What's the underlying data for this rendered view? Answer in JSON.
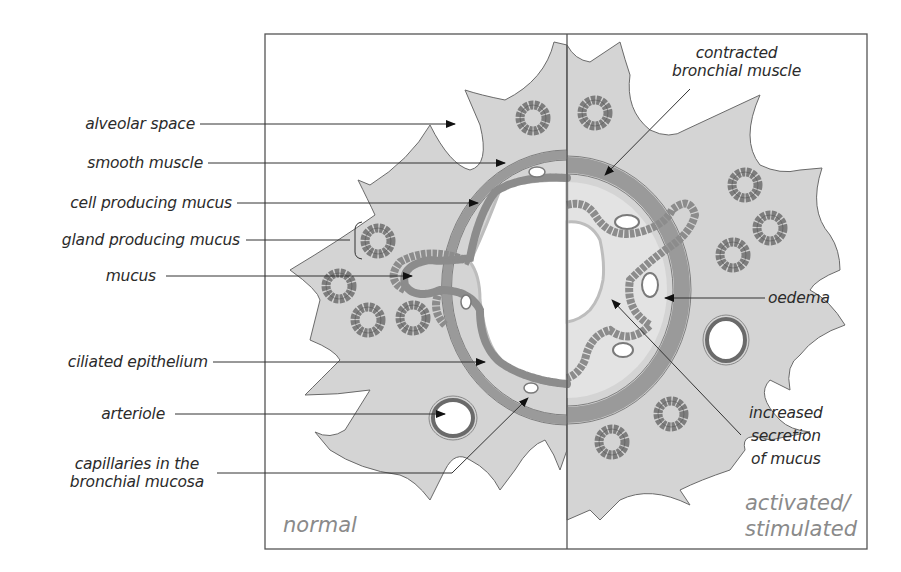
{
  "diagram": {
    "panels": {
      "left": "normal",
      "right_line1": "activated/",
      "right_line2": "stimulated"
    },
    "labels_left": [
      {
        "text": "alveolar space"
      },
      {
        "text": "smooth muscle"
      },
      {
        "text": "cell producing mucus"
      },
      {
        "text": "gland producing mucus"
      },
      {
        "text": "mucus"
      },
      {
        "text": "ciliated epithelium"
      },
      {
        "text": "arteriole"
      },
      {
        "text": "capillaries in the",
        "text2": "bronchial mucosa"
      }
    ],
    "labels_right": [
      {
        "text": "contracted",
        "text2": "bronchial muscle"
      },
      {
        "text": "oedema"
      },
      {
        "text": "increased",
        "text2": "secretion",
        "text3": "of mucus"
      }
    ],
    "colors": {
      "tissue": "#d4d4d4",
      "tissue_outline": "#6a6a6a",
      "muscle": "#9a9a9a",
      "gland": "#8c8c8c",
      "lumen": "#ffffff",
      "frame": "#555555",
      "leader": "#333333"
    }
  }
}
